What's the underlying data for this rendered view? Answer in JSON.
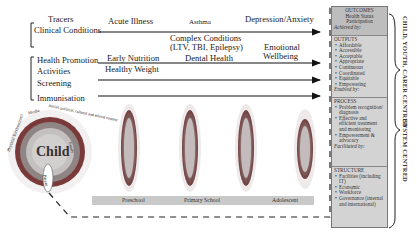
{
  "left_labels": {
    "tracers": "Tracers",
    "clinical_conditions": "Clinical Conditions",
    "health_promotion": "Health Promotion",
    "activities": "Activities",
    "screening": "Screening",
    "immunisation": "Immunisation"
  },
  "timeline_labels": {
    "acute_illness": "Acute Illness",
    "asthma": "Asthma",
    "depression_anxiety": "Depression/Anxiety",
    "complex_conditions_1": "Complex Conditions",
    "complex_conditions_2": "(LTV, TBI, Epilepsy)",
    "early_nutrition": "Early Nutrition",
    "healthy_weight": "Healthy Weight",
    "dental_health": "Dental Health",
    "emotional_1": "Emotional",
    "emotional_2": "Wellbeing"
  },
  "child_model": {
    "center": "Child",
    "rings": [
      "Family",
      "Social, political, cultural and ethical context",
      "Media",
      "Physical Environment"
    ],
    "parent_label": "Parent"
  },
  "stages": [
    "Preschool",
    "Primary School",
    "Adolescent"
  ],
  "panel": {
    "outcomes": {
      "title": "OUTCOMES",
      "items": [
        "Health Status",
        "Participation"
      ],
      "foot": "Achieved by:"
    },
    "outputs": {
      "title": "OUTPUTS",
      "items": [
        "Affordable",
        "Accessible",
        "Acceptable",
        "Appropriate",
        "Continuous",
        "Coordinated",
        "Equitable",
        "Empowering"
      ],
      "foot": "Enabled by:"
    },
    "process": {
      "title": "PROCESS",
      "items": [
        "Problem recognition/ diagnosis",
        "Effective and efficient treatment and monitoring",
        "Empowerment & advocacy"
      ],
      "foot": "Facilitated by:"
    },
    "structure": {
      "title": "STRUCTURE",
      "items": [
        "Facilities (including IT)",
        "Economic",
        "Workforce",
        "Governance (internal and international)"
      ]
    }
  },
  "side_labels": {
    "top": "CHILD, YOUTH, CARER CENTRED",
    "bottom": "SYSTEM CENTRED"
  }
}
